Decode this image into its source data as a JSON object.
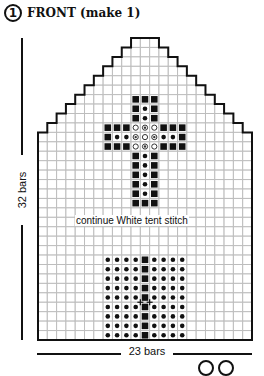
{
  "header": {
    "step_number": "1",
    "title": "FRONT (make 1)"
  },
  "dimensions": {
    "height_label": "32 bars",
    "width_label": "23 bars"
  },
  "note": "continue White tent stitch",
  "chart_data": {
    "type": "table",
    "title": "FRONT (make 1)",
    "grid": {
      "columns": 23,
      "rows": 32,
      "grid_color": "#bdbdbd",
      "outline_color": "#111111"
    },
    "top_shape": "stepped peak; flat top 4 cells wide at center, stepping down 1 cell per row to full width at row 10",
    "legend": {
      "square": "filled black square stitch",
      "dot": "small black dot stitch",
      "ring": "open circle stitch",
      "double_ring": "circle with dot stitch",
      "cross": "plus mark"
    },
    "motifs": [
      {
        "name": "cross",
        "top_row": 6,
        "left_col": 7,
        "width": 9,
        "stem_width": 3,
        "stem_top_rows": 3,
        "arm_rows": 3,
        "stem_bottom_rows": 6
      },
      {
        "name": "dotted-block",
        "top_row": 23,
        "left_col": 7,
        "width": 9,
        "rows": 9,
        "center_column": "squares"
      }
    ],
    "xlabel": "23 bars",
    "ylabel": "32 bars"
  },
  "footer": {
    "page_marks": [
      "circle",
      "circle"
    ]
  }
}
